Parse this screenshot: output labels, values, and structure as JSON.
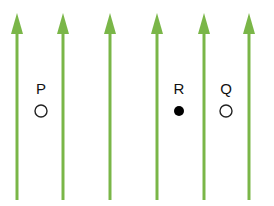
{
  "diagram": {
    "field_line_color": "#7ab648",
    "field_lines_x": [
      17,
      63,
      110,
      157,
      204,
      249
    ],
    "points": [
      {
        "label": "P",
        "x": 41,
        "y": 111,
        "filled": false
      },
      {
        "label": "R",
        "x": 179,
        "y": 111,
        "filled": true
      },
      {
        "label": "Q",
        "x": 226,
        "y": 111,
        "filled": false
      }
    ]
  }
}
